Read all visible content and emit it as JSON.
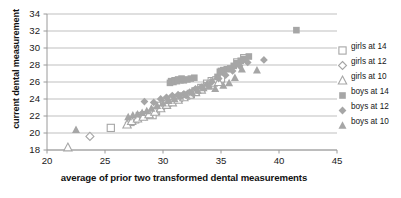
{
  "chart_data": {
    "type": "scatter",
    "title": "",
    "xlabel": "average of prior two transformed dental measurements",
    "ylabel": "current dental measurement",
    "xlim": [
      20,
      45
    ],
    "ylim": [
      18,
      34
    ],
    "xticks": [
      20,
      25,
      30,
      35,
      40,
      45
    ],
    "yticks": [
      18,
      20,
      22,
      24,
      26,
      28,
      30,
      32,
      34
    ],
    "grid": "horizontal",
    "legend_position": "right",
    "marker_color": "#a6a6a6",
    "series": [
      {
        "name": "girls at 14",
        "marker": "open-square",
        "points": [
          [
            25.5,
            20.6
          ],
          [
            27.2,
            21.3
          ],
          [
            27.6,
            21.6
          ],
          [
            28.0,
            22.0
          ],
          [
            28.4,
            22.1
          ],
          [
            28.8,
            22.2
          ],
          [
            29.1,
            22.1
          ],
          [
            29.4,
            22.6
          ],
          [
            29.7,
            23.2
          ],
          [
            30.1,
            23.4
          ],
          [
            30.5,
            23.8
          ],
          [
            30.9,
            24.0
          ],
          [
            31.2,
            24.1
          ],
          [
            31.6,
            24.3
          ],
          [
            32.0,
            24.4
          ],
          [
            32.4,
            24.6
          ],
          [
            32.8,
            24.9
          ],
          [
            33.3,
            25.3
          ],
          [
            33.8,
            25.8
          ],
          [
            34.2,
            26.1
          ],
          [
            34.6,
            26.2
          ],
          [
            35.0,
            26.4
          ],
          [
            36.4,
            28.3
          ],
          [
            37.0,
            28.8
          ]
        ]
      },
      {
        "name": "girls at 12",
        "marker": "open-diamond",
        "points": [
          [
            23.7,
            19.6
          ],
          [
            27.1,
            21.2
          ],
          [
            27.5,
            21.5
          ],
          [
            28.0,
            21.8
          ],
          [
            28.5,
            22.0
          ],
          [
            29.0,
            22.3
          ],
          [
            29.5,
            22.8
          ],
          [
            30.0,
            23.1
          ],
          [
            30.6,
            23.5
          ],
          [
            31.1,
            23.9
          ],
          [
            31.6,
            24.1
          ],
          [
            32.1,
            24.4
          ],
          [
            32.6,
            24.7
          ],
          [
            33.1,
            25.0
          ],
          [
            33.6,
            25.5
          ],
          [
            34.1,
            25.9
          ],
          [
            34.5,
            26.0
          ]
        ]
      },
      {
        "name": "girls at 10",
        "marker": "open-triangle",
        "points": [
          [
            21.8,
            18.3
          ],
          [
            26.9,
            21.0
          ],
          [
            27.3,
            21.4
          ],
          [
            27.8,
            21.7
          ],
          [
            28.3,
            21.9
          ],
          [
            28.8,
            22.2
          ],
          [
            29.3,
            22.5
          ],
          [
            29.8,
            22.9
          ],
          [
            30.3,
            23.3
          ],
          [
            30.8,
            23.6
          ],
          [
            31.3,
            23.9
          ],
          [
            31.8,
            24.2
          ],
          [
            32.3,
            24.5
          ],
          [
            32.8,
            24.8
          ],
          [
            33.3,
            25.1
          ],
          [
            33.8,
            25.6
          ],
          [
            34.3,
            25.9
          ],
          [
            34.8,
            26.0
          ]
        ]
      },
      {
        "name": "boys at 14",
        "marker": "filled-square",
        "points": [
          [
            30.6,
            25.9
          ],
          [
            30.9,
            26.0
          ],
          [
            31.2,
            26.1
          ],
          [
            31.5,
            26.2
          ],
          [
            31.8,
            26.2
          ],
          [
            32.1,
            26.3
          ],
          [
            32.4,
            26.4
          ],
          [
            32.7,
            26.5
          ],
          [
            30.7,
            26.1
          ],
          [
            31.0,
            26.2
          ],
          [
            31.3,
            26.3
          ],
          [
            31.6,
            26.4
          ],
          [
            34.7,
            26.6
          ],
          [
            35.2,
            27.4
          ],
          [
            35.5,
            27.5
          ],
          [
            35.8,
            27.6
          ],
          [
            36.1,
            27.9
          ],
          [
            36.4,
            28.2
          ],
          [
            36.7,
            28.5
          ],
          [
            37.0,
            28.7
          ],
          [
            37.4,
            29.0
          ],
          [
            34.9,
            27.2
          ],
          [
            35.0,
            27.3
          ],
          [
            41.5,
            32.1
          ]
        ]
      },
      {
        "name": "boys at 12",
        "marker": "filled-diamond",
        "points": [
          [
            28.4,
            23.7
          ],
          [
            29.2,
            23.6
          ],
          [
            29.8,
            24.0
          ],
          [
            30.3,
            24.2
          ],
          [
            30.8,
            24.4
          ],
          [
            31.3,
            24.5
          ],
          [
            31.8,
            24.6
          ],
          [
            32.3,
            24.8
          ],
          [
            32.8,
            25.2
          ],
          [
            33.3,
            25.4
          ],
          [
            33.8,
            25.7
          ],
          [
            34.2,
            26.0
          ],
          [
            34.8,
            26.4
          ],
          [
            35.4,
            26.8
          ],
          [
            36.0,
            27.3
          ],
          [
            36.6,
            27.9
          ],
          [
            37.3,
            28.3
          ],
          [
            38.7,
            28.6
          ]
        ]
      },
      {
        "name": "boys at 10",
        "marker": "filled-triangle",
        "points": [
          [
            22.5,
            20.4
          ],
          [
            27.0,
            21.9
          ],
          [
            27.4,
            22.1
          ],
          [
            27.8,
            22.2
          ],
          [
            28.2,
            22.4
          ],
          [
            28.6,
            22.6
          ],
          [
            29.0,
            22.9
          ],
          [
            29.5,
            23.2
          ],
          [
            30.0,
            23.5
          ],
          [
            30.5,
            23.8
          ],
          [
            31.0,
            24.0
          ],
          [
            31.5,
            24.3
          ],
          [
            32.0,
            24.5
          ],
          [
            32.5,
            24.8
          ],
          [
            33.0,
            25.0
          ],
          [
            33.5,
            25.3
          ],
          [
            34.0,
            25.5
          ],
          [
            34.5,
            25.2
          ],
          [
            35.2,
            25.6
          ],
          [
            35.7,
            25.9
          ],
          [
            36.2,
            26.5
          ],
          [
            36.8,
            27.5
          ],
          [
            38.1,
            27.4
          ]
        ]
      }
    ]
  },
  "axes": {
    "y_title": "current dental measurement",
    "x_title": "average of prior two transformed dental measurements",
    "y_tick_labels": [
      "34",
      "32",
      "30",
      "28",
      "26",
      "24",
      "22",
      "20",
      "18"
    ],
    "x_tick_labels": [
      "20",
      "25",
      "30",
      "35",
      "40",
      "45"
    ]
  },
  "legend": {
    "items": [
      {
        "label": "girls at 14",
        "marker": "open-square"
      },
      {
        "label": "girls at 12",
        "marker": "open-diamond"
      },
      {
        "label": "girls at 10",
        "marker": "open-triangle"
      },
      {
        "label": "boys at 14",
        "marker": "filled-square"
      },
      {
        "label": "boys at 12",
        "marker": "filled-diamond"
      },
      {
        "label": "boys at 10",
        "marker": "filled-triangle"
      }
    ]
  },
  "colors": {
    "marker": "#a8a8a8",
    "marker_dark": "#9a9a9a",
    "gridline": "#b8b8b8",
    "axis": "#9a9a9a",
    "text": "#1a1a1a"
  }
}
